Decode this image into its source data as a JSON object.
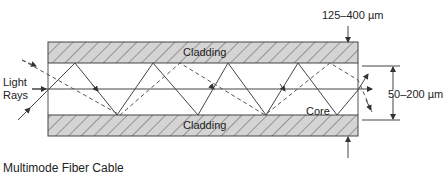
{
  "diagram": {
    "type": "multimode fiber cable cross-section",
    "caption": "Multimode Fiber Cable",
    "labels": {
      "light_rays_line1": "Light",
      "light_rays_line2": "Rays",
      "cladding_top": "Cladding",
      "cladding_bottom": "Cladding",
      "core": "Core",
      "outer_diameter": "125–400 µm",
      "core_diameter": "50–200 µm"
    },
    "colors": {
      "cladding_fill": "#d4d4d4",
      "hatch": "#555555",
      "line": "#444444"
    },
    "components": [
      {
        "name": "Cladding",
        "position": "top"
      },
      {
        "name": "Core",
        "position": "center"
      },
      {
        "name": "Cladding",
        "position": "bottom"
      }
    ],
    "rays": [
      {
        "style": "solid",
        "description": "zig-zag ray reflecting between core/cladding boundaries"
      },
      {
        "style": "dashed",
        "description": "higher-angle zig-zag ray"
      },
      {
        "style": "solid",
        "description": "axial ray along the core center"
      }
    ],
    "dimensions": [
      {
        "label": "125–400 µm",
        "measures": "outer cladding diameter"
      },
      {
        "label": "50–200 µm",
        "measures": "core diameter"
      }
    ]
  }
}
